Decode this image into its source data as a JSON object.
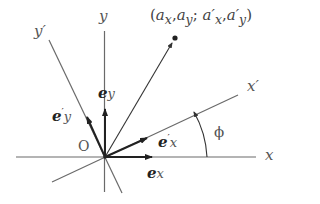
{
  "diagram": {
    "type": "rotated-coordinate-axes",
    "colors": {
      "axis": "#6a6a6a",
      "vector": "#222222",
      "label": "#555555",
      "background": "#ffffff"
    },
    "origin": {
      "label": "O"
    },
    "axes": {
      "x": {
        "label": "x"
      },
      "y": {
        "label": "y"
      },
      "x_prime": {
        "label": "x′"
      },
      "y_prime": {
        "label": "y′"
      }
    },
    "unit_vectors": {
      "e_x": {
        "base": "e",
        "sub": "x",
        "prime": ""
      },
      "e_y": {
        "base": "e",
        "sub": "y",
        "prime": ""
      },
      "e_x_prime": {
        "base": "e",
        "sub": "x",
        "prime": "′"
      },
      "e_y_prime": {
        "base": "e",
        "sub": "y",
        "prime": "′"
      }
    },
    "angle": {
      "label": "ϕ",
      "degrees": 25
    },
    "point": {
      "label_open": "(",
      "ax": "a",
      "ax_sub": "x",
      "sep1": ",",
      "ay": "a",
      "ay_sub": "y",
      "sep2": ";",
      "axp": "a′",
      "axp_sub": "x",
      "sep3": ",",
      "ayp": "a′",
      "ayp_sub": "y",
      "label_close": ")"
    }
  }
}
